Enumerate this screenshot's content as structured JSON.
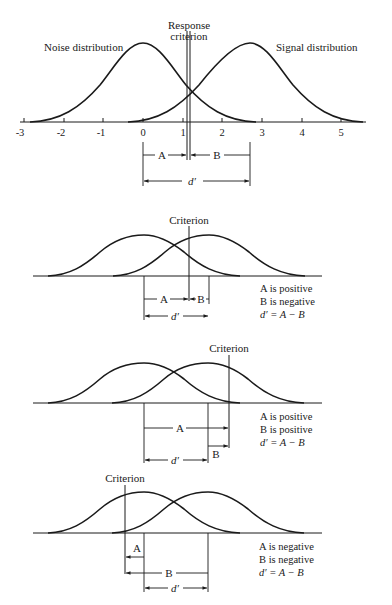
{
  "diagrams": [
    {
      "id": "main",
      "labels": {
        "noise": "Noise distribution",
        "signal": "Signal distribution",
        "criterion_line1": "Response",
        "criterion_line2": "criterion",
        "a": "A",
        "b": "B",
        "dprime": "d′"
      },
      "axis_ticks": [
        "-3",
        "-2",
        "-1",
        "0",
        "1",
        "2",
        "3",
        "4",
        "5"
      ],
      "noise_mean": 0,
      "signal_mean": 2.7,
      "criterion": 1.1
    },
    {
      "id": "case-1",
      "labels": {
        "criterion": "Criterion",
        "a": "A",
        "b": "B",
        "dprime": "d′",
        "note1": "A is positive",
        "note2": "B is negative",
        "note3": "d′ = A − B"
      }
    },
    {
      "id": "case-2",
      "labels": {
        "criterion": "Criterion",
        "a": "A",
        "b": "B",
        "dprime": "d′",
        "note1": "A is positive",
        "note2": "B is positive",
        "note3": "d′ = A − B"
      }
    },
    {
      "id": "case-3",
      "labels": {
        "criterion": "Criterion",
        "a": "A",
        "b": "B",
        "dprime": "d′",
        "note1": "A is negative",
        "note2": "B is negative",
        "note3": "d′ = A − B"
      }
    }
  ],
  "colors": {
    "ink": "#1a1a1a",
    "background": "#ffffff"
  }
}
